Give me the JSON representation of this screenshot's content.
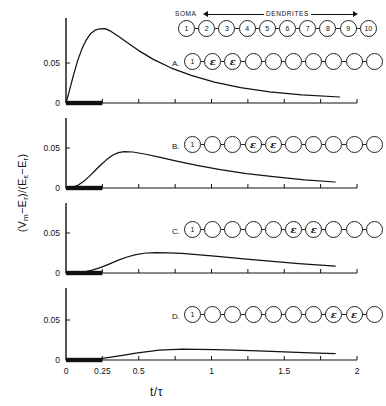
{
  "figure": {
    "ylabel_main": "(V",
    "ylabel_full": "(Vm − Er)/(Eε − Er)",
    "xlabel": "t/τ"
  },
  "axis": {
    "y_ticks": [
      "0",
      "0.05"
    ],
    "y_values": [
      0,
      0.05
    ],
    "ylim": [
      0,
      0.105
    ],
    "x_ticks": [
      "0",
      "0.25",
      "0.5",
      "1",
      "1.5",
      "2"
    ],
    "x_values": [
      0,
      0.25,
      0.5,
      1,
      1.5,
      2
    ],
    "xlim": [
      0,
      2
    ],
    "minor_x_values": [
      0.25,
      0.5,
      0.75,
      1,
      1.25,
      1.5,
      1.75,
      2
    ]
  },
  "ylabel_parts": {
    "p1": "(V",
    "sub1": "m",
    "p2": "−E",
    "sub2": "r",
    "p3": ")/(E",
    "sub3": "ε",
    "p4": "−E",
    "sub4": "r",
    "p5": ")"
  },
  "header": {
    "soma_label": "SOMA",
    "dendrites_label": "DENDRITES",
    "node_labels": [
      "1",
      "2",
      "3",
      "4",
      "5",
      "6",
      "7",
      "8",
      "9",
      "10"
    ]
  },
  "stimulus": {
    "bar_start": 0,
    "bar_end": 0.25,
    "note": "input conductance transient bar"
  },
  "panels": [
    {
      "letter": "A.",
      "soma_label": "1",
      "marked_nodes": [
        2,
        3
      ],
      "marker_glyph": "ε",
      "peak_t": 0.27,
      "peak_v": 0.093,
      "end_t": 1.88,
      "end_v": 0.0075
    },
    {
      "letter": "B.",
      "soma_label": "1",
      "marked_nodes": [
        4,
        5
      ],
      "marker_glyph": "ε",
      "peak_t": 0.39,
      "peak_v": 0.0455,
      "end_t": 1.85,
      "end_v": 0.0075
    },
    {
      "letter": "C.",
      "soma_label": "1",
      "marked_nodes": [
        6,
        7
      ],
      "marker_glyph": "ε",
      "peak_t": 0.57,
      "peak_v": 0.0255,
      "end_t": 1.85,
      "end_v": 0.0085
    },
    {
      "letter": "D.",
      "soma_label": "1",
      "marked_nodes": [
        8,
        9
      ],
      "marker_glyph": "ε",
      "peak_t": 0.78,
      "peak_v": 0.0135,
      "end_t": 1.85,
      "end_v": 0.008
    }
  ],
  "chart_data": {
    "type": "line",
    "title": "",
    "xlabel": "t/τ",
    "ylabel": "(Vm − Er)/(Eε − Er)",
    "xlim": [
      0,
      2
    ],
    "ylim": [
      0,
      0.105
    ],
    "grid": false,
    "legend": "none",
    "panel_layout": "4 stacked panels A-D, shared x axis",
    "series": [
      {
        "name": "A",
        "synapse_nodes": [
          2,
          3
        ],
        "x": [
          0,
          0.02,
          0.05,
          0.08,
          0.11,
          0.14,
          0.17,
          0.2,
          0.23,
          0.27,
          0.31,
          0.36,
          0.42,
          0.5,
          0.6,
          0.72,
          0.86,
          1.02,
          1.2,
          1.4,
          1.62,
          1.88
        ],
        "y": [
          0,
          0.013,
          0.034,
          0.053,
          0.068,
          0.079,
          0.087,
          0.091,
          0.0928,
          0.093,
          0.0895,
          0.0835,
          0.0755,
          0.0655,
          0.0545,
          0.044,
          0.0345,
          0.0262,
          0.0192,
          0.014,
          0.0102,
          0.0075
        ]
      },
      {
        "name": "B",
        "synapse_nodes": [
          4,
          5
        ],
        "x": [
          0,
          0.04,
          0.08,
          0.12,
          0.16,
          0.2,
          0.24,
          0.28,
          0.32,
          0.36,
          0.4,
          0.46,
          0.54,
          0.64,
          0.76,
          0.9,
          1.06,
          1.24,
          1.44,
          1.64,
          1.85
        ],
        "y": [
          0,
          0.0006,
          0.0032,
          0.008,
          0.0145,
          0.0218,
          0.029,
          0.0355,
          0.041,
          0.0443,
          0.0455,
          0.045,
          0.0425,
          0.0385,
          0.0335,
          0.0282,
          0.023,
          0.018,
          0.0138,
          0.0103,
          0.0075
        ]
      },
      {
        "name": "C",
        "synapse_nodes": [
          6,
          7
        ],
        "x": [
          0,
          0.06,
          0.12,
          0.18,
          0.24,
          0.3,
          0.36,
          0.42,
          0.48,
          0.55,
          0.62,
          0.7,
          0.8,
          0.92,
          1.06,
          1.22,
          1.4,
          1.6,
          1.85
        ],
        "y": [
          0,
          0.0002,
          0.0012,
          0.0035,
          0.007,
          0.0115,
          0.016,
          0.02,
          0.023,
          0.025,
          0.0255,
          0.0253,
          0.0245,
          0.0228,
          0.0205,
          0.0178,
          0.0148,
          0.0118,
          0.0085
        ]
      },
      {
        "name": "D",
        "synapse_nodes": [
          8,
          9
        ],
        "x": [
          0,
          0.08,
          0.16,
          0.24,
          0.32,
          0.4,
          0.48,
          0.56,
          0.64,
          0.72,
          0.8,
          0.9,
          1.02,
          1.16,
          1.32,
          1.5,
          1.68,
          1.85
        ],
        "y": [
          0,
          0.0001,
          0.0006,
          0.0018,
          0.0038,
          0.0062,
          0.0086,
          0.0106,
          0.0122,
          0.0131,
          0.0135,
          0.0134,
          0.013,
          0.0123,
          0.0113,
          0.0101,
          0.009,
          0.008
        ]
      }
    ]
  }
}
